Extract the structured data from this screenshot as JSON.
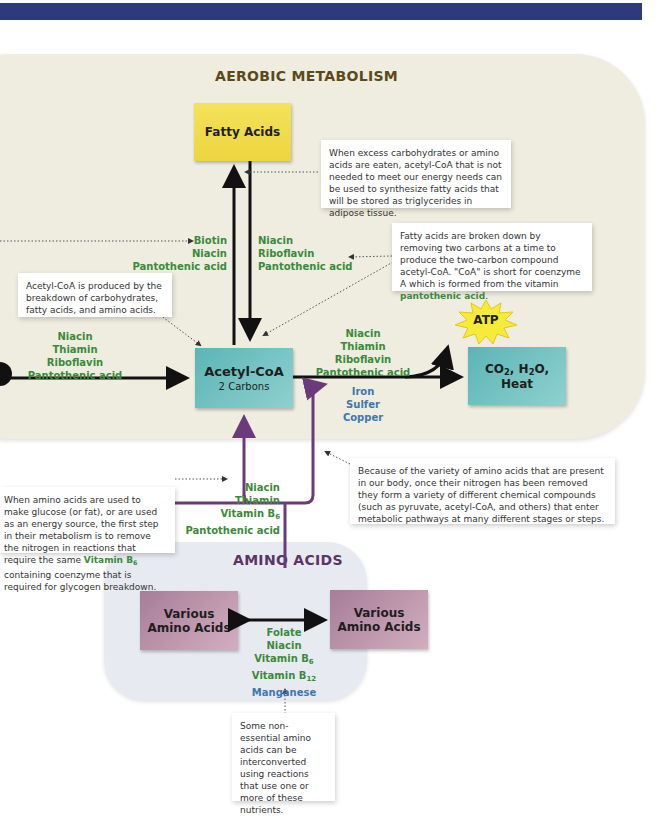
{
  "header_bar": {
    "color": "#2e3a80"
  },
  "aerobic": {
    "title": "AEROBIC METABOLISM",
    "title_color": "#5a4a1a",
    "fatty_acids_box": "Fatty Acids",
    "acetyl_coa_box": {
      "title": "Acetyl-CoA",
      "subtitle": "2 Carbons"
    },
    "products_box": {
      "line1_parts": [
        "CO",
        "2",
        ", H",
        "2",
        "O,"
      ],
      "line2": "Heat"
    },
    "atp_label": "ATP",
    "synthesis_nutrients": [
      "Biotin",
      "Niacin",
      "Pantothenic acid"
    ],
    "breakdown_nutrients": [
      "Niacin",
      "Riboflavin",
      "Pantothenic acid"
    ],
    "input_nutrients": [
      "Niacin",
      "Thiamin",
      "Riboflavin",
      "Pantothenic acid"
    ],
    "krebs_nutrients_green": [
      "Niacin",
      "Thiamin",
      "Riboflavin",
      "Pantothenic acid"
    ],
    "krebs_minerals_blue": [
      "Iron",
      "Sulfer",
      "Copper"
    ],
    "note_synthesis": "When excess carbohydrates or amino acids are eaten, acetyl-CoA that is not needed to meet our energy needs can be used to synthesize fatty acids that will be stored as triglycerides in adipose tissue.",
    "note_breakdown_prefix": "Fatty acids are broken down by removing two carbons at a time to produce the two-carbon compound acetyl-CoA. \"CoA\" is short for coenzyme A which is formed from the vitamin ",
    "note_breakdown_highlight": "pantothenic acid",
    "note_breakdown_suffix": ".",
    "note_acetyl": "Acetyl-CoA is produced by the breakdown of carbohydrates, fatty acids, and amino acids."
  },
  "transition": {
    "nutrients": [
      "Niacin",
      "Thiamin",
      "Vitamin B",
      "Pantothenic acid"
    ],
    "vitamin_b_sub": "6",
    "note_deamination_prefix": "When amino acids are used to make glucose (or fat), or are used as an energy source, the first step in their metabolism is to remove the nitrogen in reactions that require the same ",
    "note_deamination_highlight": "Vitamin B",
    "note_deamination_highlight_sub": "6",
    "note_deamination_suffix": " containing coenzyme that is required for glycogen breakdown.",
    "note_variety": "Because of the variety of amino acids that are present in our body, once their nitrogen has been removed they form a variety of different chemical compounds (such as pyruvate, acetyl-CoA, and others) that enter metabolic pathways at many different stages or steps."
  },
  "amino": {
    "title": "AMINO ACIDS",
    "title_color": "#5a3566",
    "left_box": [
      "Various",
      "Amino Acids"
    ],
    "right_box": [
      "Various",
      "Amino Acids"
    ],
    "nutrients": [
      {
        "text": "Folate",
        "sub": "",
        "color": "green"
      },
      {
        "text": "Niacin",
        "sub": "",
        "color": "green"
      },
      {
        "text": "Vitamin B",
        "sub": "6",
        "color": "green"
      },
      {
        "text": "Vitamin B",
        "sub": "12",
        "color": "green"
      },
      {
        "text": "Manganese",
        "sub": "",
        "color": "blue"
      }
    ],
    "note_interconvert": "Some non-essential amino acids can be interconverted using reactions that use one or more of these nutrients."
  },
  "colors": {
    "green": "#3a8a3a",
    "blue": "#3e77b0",
    "purple": "#6b3a78",
    "black": "#111111"
  }
}
